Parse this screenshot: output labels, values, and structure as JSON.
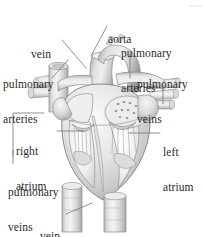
{
  "figure": {
    "width": 203,
    "height": 237,
    "style": "grayscale pencil-shaded medical illustration",
    "background_color": "#ffffff",
    "label_color": "#2b2b2b",
    "leader_color": "#6e6e6e"
  },
  "labels": [
    {
      "id": "vein-top",
      "name": "vein",
      "lines": [
        "vein"
      ],
      "text_x": 31,
      "text_y": 32,
      "align": "left",
      "leader": {
        "type": "diagonal",
        "x1": 62,
        "y1": 40,
        "x2": 84,
        "y2": 66
      }
    },
    {
      "id": "aorta",
      "name": "aorta",
      "lines": [
        "aorta"
      ],
      "text_x": 108,
      "text_y": 17,
      "align": "left",
      "leader": {
        "type": "diagonal",
        "x1": 107,
        "y1": 26,
        "x2": 90,
        "y2": 56
      }
    },
    {
      "id": "pulmonary-arteries-right",
      "name": "pulmonary arteries",
      "lines": [
        "pulmonary",
        "arteries"
      ],
      "text_x": 121,
      "text_y": 29,
      "align": "left",
      "leader": {
        "type": "vertical",
        "x1": 130,
        "y1": 54,
        "x2": 130,
        "y2": 76
      }
    },
    {
      "id": "pulmonary-veins-right",
      "name": "pulmonary veins",
      "lines": [
        "pulmonary",
        "veins"
      ],
      "text_x": 137,
      "text_y": 60,
      "align": "left",
      "leader": {
        "type": "vertical",
        "x1": 163,
        "y1": 85,
        "x2": 163,
        "y2": 103
      }
    },
    {
      "id": "pulmonary-arteries-left",
      "name": "pulmonary arteries",
      "lines": [
        "pulmonary",
        "arteries"
      ],
      "text_x": 3,
      "text_y": 60,
      "align": "left",
      "leader": {
        "type": "diagonal",
        "x1": 53,
        "y1": 76,
        "x2": 68,
        "y2": 60
      }
    },
    {
      "id": "right-atrium",
      "name": "right atrium",
      "lines": [
        "right",
        "atrium"
      ],
      "text_x": 16,
      "text_y": 127,
      "align": "left",
      "leader": {
        "type": "horizontal",
        "x1": 56,
        "y1": 131,
        "x2": 83,
        "y2": 131
      },
      "bracket": {
        "x": 13,
        "y_top": 113,
        "y_bottom": 156,
        "arm_x2": 44
      }
    },
    {
      "id": "left-atrium",
      "name": "left atrium",
      "lines": [
        "left",
        "atrium"
      ],
      "text_x": 163,
      "text_y": 128,
      "align": "left",
      "leader": {
        "type": "horizontal",
        "x1": 130,
        "y1": 133,
        "x2": 160,
        "y2": 133
      }
    },
    {
      "id": "pulmonary-veins-left",
      "name": "pulmonary veins",
      "lines": [
        "pulmonary",
        "veins"
      ],
      "text_x": 8,
      "text_y": 168,
      "align": "left",
      "leader": {
        "type": "vertical",
        "x1": 13,
        "y1": 150,
        "x2": 13,
        "y2": 164
      }
    },
    {
      "id": "vein-bottom",
      "name": "vein",
      "lines": [
        "vein"
      ],
      "text_x": 40,
      "text_y": 213,
      "align": "left",
      "leader": {
        "type": "diagonal",
        "x1": 66,
        "y1": 214,
        "x2": 90,
        "y2": 203
      }
    }
  ],
  "anatomy_parts": [
    "aorta",
    "pulmonary trunk and arteries",
    "superior vena cava (vein)",
    "inferior vena cava (vein)",
    "pulmonary veins",
    "right atrium",
    "left atrium",
    "right ventricle",
    "left ventricle",
    "atrioventricular valves",
    "chordae tendineae",
    "interventricular septum"
  ]
}
